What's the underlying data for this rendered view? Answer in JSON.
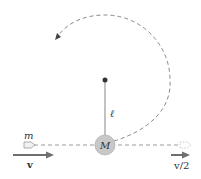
{
  "diagram": {
    "labels": {
      "bullet_mass": "m",
      "bob_mass": "M",
      "rod_length": "ℓ",
      "initial_velocity": "v",
      "final_velocity": "v/2"
    },
    "colors": {
      "path": "#8a8a8a",
      "rod": "#9a9a9a",
      "pivot": "#333333",
      "bob_fill": "#c8c8c8",
      "bob_stroke": "#b0b0b0",
      "velocity_arrow": "#6e6e6e",
      "text": "#333333"
    },
    "geometry": {
      "pivot": [
        105,
        80
      ],
      "bob_center": [
        105,
        145
      ],
      "bob_radius": 10,
      "circle_radius": 65
    }
  }
}
